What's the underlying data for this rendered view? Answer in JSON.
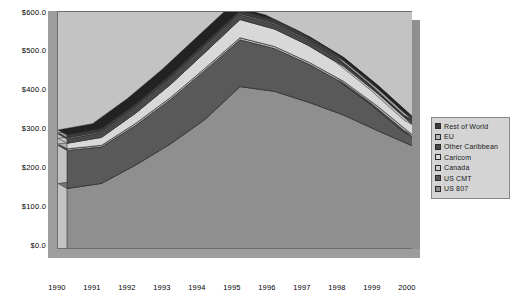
{
  "chart_data": {
    "type": "area",
    "stacked": true,
    "title": "",
    "xlabel": "",
    "ylabel": "",
    "grid": false,
    "legend_position": "right",
    "x": [
      "1990",
      "1991",
      "1992",
      "1993",
      "1994",
      "1995",
      "1996",
      "1997",
      "1998",
      "1999",
      "2000"
    ],
    "xtick_labels": [
      "1990",
      "1991",
      "1992",
      "1993",
      "1994",
      "1995",
      "1996",
      "1997",
      "1998",
      "1999",
      "2000"
    ],
    "ytick_labels": [
      "$600.0",
      "$500.0",
      "$400.0",
      "$300.0",
      "$200.0",
      "$100.0",
      "$0.0"
    ],
    "ytick_values": [
      600,
      500,
      400,
      300,
      200,
      100,
      0
    ],
    "ylim": [
      0,
      600
    ],
    "series": [
      {
        "name": "US 807",
        "color": "#8f8f8f",
        "values": [
          155,
          168,
          215,
          268,
          330,
          412,
          400,
          372,
          340,
          300,
          262
        ]
      },
      {
        "name": "US CMT",
        "color": "#595959",
        "values": [
          96,
          92,
          100,
          112,
          124,
          118,
          108,
          96,
          80,
          56,
          22
        ]
      },
      {
        "name": "Canada",
        "color": "#c9c9c9",
        "values": [
          4,
          4,
          5,
          5,
          5,
          5,
          5,
          5,
          5,
          5,
          5
        ]
      },
      {
        "name": "Caricom",
        "color": "#d8d8d8",
        "values": [
          14,
          20,
          26,
          33,
          40,
          46,
          44,
          42,
          38,
          32,
          26
        ]
      },
      {
        "name": "Other Caribbean",
        "color": "#4a4a4a",
        "values": [
          11,
          12,
          12,
          13,
          13,
          12,
          12,
          12,
          11,
          10,
          9
        ]
      },
      {
        "name": "EU",
        "color": "#b5b5b5",
        "values": [
          3,
          3,
          3,
          3,
          3,
          3,
          3,
          3,
          3,
          3,
          3
        ]
      },
      {
        "name": "Rest of World",
        "color": "#3c3c3c",
        "values": [
          7,
          7,
          8,
          8,
          8,
          8,
          8,
          8,
          8,
          8,
          8
        ]
      }
    ]
  },
  "legend": {
    "items": [
      {
        "label": "Rest of World",
        "color": "#3c3c3c"
      },
      {
        "label": "EU",
        "color": "#b5b5b5"
      },
      {
        "label": "Other Caribbean",
        "color": "#4a4a4a"
      },
      {
        "label": "Caricom",
        "color": "#d8d8d8"
      },
      {
        "label": "Canada",
        "color": "#c9c9c9"
      },
      {
        "label": "US CMT",
        "color": "#595959"
      },
      {
        "label": "US 807",
        "color": "#8f8f8f"
      }
    ]
  },
  "colors": {
    "plot_background": "#c3c3c3",
    "wall": "#9d9d9d",
    "frame": "#6e6e6e",
    "legend_background": "#d4d4d4"
  }
}
